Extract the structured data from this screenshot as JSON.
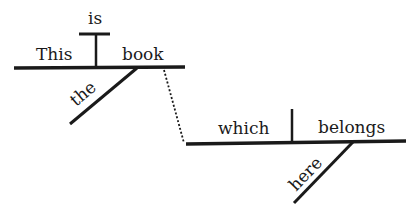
{
  "diagram": {
    "type": "sentence-diagram",
    "sentence": "This book is the which belongs here",
    "ink_color": "#1a1a1a",
    "background": "#ffffff",
    "main_clause": {
      "subject": "This",
      "verb": "is",
      "predicate": "book",
      "modifier": "the"
    },
    "relative_clause": {
      "subject": "which",
      "verb": "belongs",
      "modifier": "here"
    }
  }
}
